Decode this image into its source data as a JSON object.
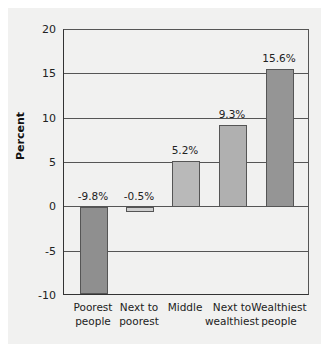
{
  "chart_data": {
    "type": "bar",
    "title": "",
    "xlabel": "",
    "ylabel": "Percent",
    "ylim": [
      -10,
      20
    ],
    "yticks": [
      20,
      15,
      10,
      5,
      0,
      -5,
      -10
    ],
    "grid": true,
    "categories": [
      "Poorest people",
      "Next to poorest",
      "Middle",
      "Next to wealthiest",
      "Wealthiest people"
    ],
    "category_lines": [
      [
        "Poorest",
        "people"
      ],
      [
        "Next to",
        "poorest"
      ],
      [
        "Middle",
        ""
      ],
      [
        "Next to",
        "wealthiest"
      ],
      [
        "Wealthiest",
        "people"
      ]
    ],
    "values": [
      -9.8,
      -0.5,
      5.2,
      9.3,
      15.6
    ],
    "value_labels": [
      "-9.8%",
      "-0.5%",
      "5.2%",
      "9.3%",
      "15.6%"
    ],
    "colors": [
      "#8f8f8f",
      "#cfcfcf",
      "#b9b9b9",
      "#b0b0b0",
      "#959595"
    ]
  }
}
